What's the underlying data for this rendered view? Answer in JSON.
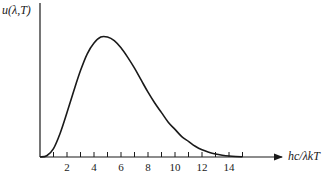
{
  "chart_data": {
    "type": "line",
    "title": "",
    "xlabel": "hc/λkT",
    "ylabel": "u(λ,T)",
    "x_tick_labels": [
      "2",
      "4",
      "6",
      "8",
      "10",
      "12",
      "14"
    ],
    "x_ticks_minor_every": 1,
    "xlim": [
      0,
      15
    ],
    "ylim": [
      0,
      1.15
    ],
    "y_ticks": [],
    "grid": false,
    "legend": null,
    "series": [
      {
        "name": "u(λ,T)",
        "x": [
          0,
          0.5,
          1,
          1.5,
          2,
          2.5,
          3,
          3.5,
          4,
          4.5,
          5,
          5.5,
          6,
          6.5,
          7,
          7.5,
          8,
          8.5,
          9,
          9.5,
          10,
          10.5,
          11,
          11.5,
          12,
          12.5,
          13,
          13.5,
          14,
          14.5,
          15
        ],
        "values": [
          0,
          0.01,
          0.07,
          0.2,
          0.37,
          0.55,
          0.72,
          0.86,
          0.95,
          1.0,
          1.0,
          0.97,
          0.91,
          0.83,
          0.74,
          0.64,
          0.54,
          0.45,
          0.37,
          0.29,
          0.23,
          0.17,
          0.13,
          0.09,
          0.06,
          0.04,
          0.025,
          0.015,
          0.008,
          0.004,
          0.002
        ]
      }
    ],
    "annotations": [],
    "peak_x": 5
  },
  "labels": {
    "y_axis": "u(λ,T)",
    "x_axis": "hc/λkT"
  },
  "colors": {
    "line": "#1a1a1a",
    "background": "#ffffff"
  }
}
